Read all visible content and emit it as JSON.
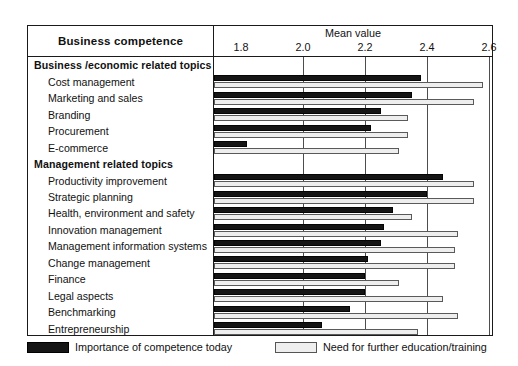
{
  "header": {
    "left_title": "Business competence",
    "mean_title": "Mean value"
  },
  "legend": {
    "dark_label": "Importance of competence today",
    "light_label": "Need for further education/training"
  },
  "chart_data": {
    "type": "bar",
    "orientation": "horizontal",
    "title": "Mean value",
    "xlabel": "Mean value",
    "ylabel": "Business competence",
    "xlim": [
      1.8,
      2.6
    ],
    "xticks": [
      1.8,
      2.0,
      2.2,
      2.4,
      2.6
    ],
    "xtick_labels": [
      "1.8",
      "2.0",
      "2.2",
      "2.4",
      "2.6"
    ],
    "grid": true,
    "legend_position": "bottom",
    "series": [
      {
        "name": "Importance of competence today",
        "color": "#151515"
      },
      {
        "name": "Need for further education/training",
        "color": "#eeeeee"
      }
    ],
    "rows": [
      {
        "label": "Business /economic  related topics",
        "type": "section"
      },
      {
        "label": "Cost management",
        "type": "item",
        "importance": 2.38,
        "need": 2.58
      },
      {
        "label": "Marketing and sales",
        "type": "item",
        "importance": 2.35,
        "need": 2.55
      },
      {
        "label": "Branding",
        "type": "item",
        "importance": 2.25,
        "need": 2.34
      },
      {
        "label": "Procurement",
        "type": "item",
        "importance": 2.22,
        "need": 2.34
      },
      {
        "label": "E-commerce",
        "type": "item",
        "importance": 1.82,
        "need": 2.31
      },
      {
        "label": "Management  related topics",
        "type": "section"
      },
      {
        "label": "Productivity improvement",
        "type": "item",
        "importance": 2.45,
        "need": 2.55
      },
      {
        "label": "Strategic planning",
        "type": "item",
        "importance": 2.4,
        "need": 2.55
      },
      {
        "label": "Health, environment and safety",
        "type": "item",
        "importance": 2.29,
        "need": 2.35
      },
      {
        "label": "Innovation management",
        "type": "item",
        "importance": 2.26,
        "need": 2.5
      },
      {
        "label": "Management information systems",
        "type": "item",
        "importance": 2.25,
        "need": 2.49
      },
      {
        "label": "Change management",
        "type": "item",
        "importance": 2.21,
        "need": 2.49
      },
      {
        "label": "Finance",
        "type": "item",
        "importance": 2.2,
        "need": 2.31
      },
      {
        "label": "Legal aspects",
        "type": "item",
        "importance": 2.2,
        "need": 2.45
      },
      {
        "label": "Benchmarking",
        "type": "item",
        "importance": 2.15,
        "need": 2.5
      },
      {
        "label": "Entrepreneurship",
        "type": "item",
        "importance": 2.06,
        "need": 2.37
      }
    ]
  }
}
